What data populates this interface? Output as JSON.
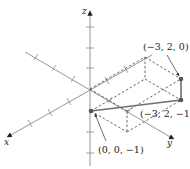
{
  "diagram": {
    "type": "3d-coordinate-plot",
    "axes": {
      "x": {
        "label": "x"
      },
      "y": {
        "label": "y"
      },
      "z": {
        "label": "z"
      }
    },
    "points": [
      {
        "label": "(−3, 2, 0)",
        "coords": [
          -3,
          2,
          0
        ]
      },
      {
        "label": "(−3, 2, −1)",
        "coords": [
          -3,
          2,
          -1
        ]
      },
      {
        "label": "(0, 0, −1)",
        "coords": [
          0,
          0,
          -1
        ]
      }
    ],
    "segments": [
      {
        "from": "(0, 0, −1)",
        "to": "(−3, 2, −1)"
      },
      {
        "from": "(−3, 2, −1)",
        "to": "(−3, 2, 0)"
      }
    ],
    "colors": {
      "axis": "#8a8a8a",
      "dashed_box": "#444444",
      "segment": "#6f6f6f",
      "point": "#555555"
    }
  }
}
